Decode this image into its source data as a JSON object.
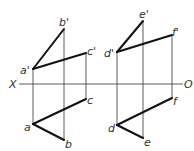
{
  "diagram": {
    "axis": {
      "left_label": "X",
      "right_label": "O",
      "y": 84,
      "x_start": 19,
      "x_end": 183
    },
    "points": {
      "a_prime": {
        "label": "a'",
        "x": 33,
        "y": 69
      },
      "b_prime": {
        "label": "b'",
        "x": 64,
        "y": 29
      },
      "c_prime": {
        "label": "c'",
        "x": 86,
        "y": 53
      },
      "a": {
        "label": "a",
        "x": 33,
        "y": 124
      },
      "b": {
        "label": "b",
        "x": 64,
        "y": 140
      },
      "c": {
        "label": "c",
        "x": 86,
        "y": 99
      },
      "d_prime": {
        "label": "d'",
        "x": 117,
        "y": 52
      },
      "e_prime": {
        "label": "e'",
        "x": 143,
        "y": 21
      },
      "f_prime": {
        "label": "f'",
        "x": 172,
        "y": 35
      },
      "d": {
        "label": "d",
        "x": 117,
        "y": 125
      },
      "e": {
        "label": "e",
        "x": 143,
        "y": 138
      },
      "f": {
        "label": "f",
        "x": 172,
        "y": 98
      }
    },
    "thick_segments": [
      [
        "a_prime",
        "b_prime"
      ],
      [
        "a_prime",
        "c_prime"
      ],
      [
        "a",
        "b"
      ],
      [
        "a",
        "c"
      ],
      [
        "d_prime",
        "e_prime"
      ],
      [
        "d_prime",
        "f_prime"
      ],
      [
        "d",
        "e"
      ],
      [
        "d",
        "f"
      ]
    ],
    "projection_lines": [
      [
        "a_prime",
        "a"
      ],
      [
        "b_prime",
        "b"
      ],
      [
        "c_prime",
        "c"
      ],
      [
        "d_prime",
        "d"
      ],
      [
        "e_prime",
        "e"
      ],
      [
        "f_prime",
        "f"
      ]
    ],
    "colors": {
      "line": "#111111",
      "thin_line": "#333333",
      "background": "#ffffff"
    }
  }
}
